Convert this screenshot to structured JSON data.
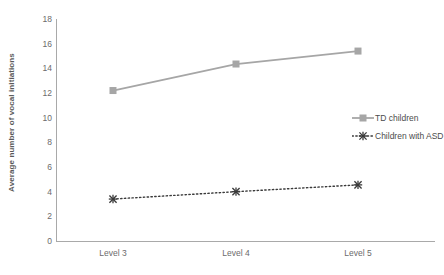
{
  "chart_data": {
    "type": "line",
    "title": "",
    "xlabel": "",
    "ylabel": "Average number of vocal initiations",
    "categories": [
      "Level 3",
      "Level 4",
      "Level 5"
    ],
    "ylim": [
      0,
      18
    ],
    "ytick_step": 2,
    "yticks": [
      "18",
      "16",
      "14",
      "12",
      "10",
      "8",
      "6",
      "4",
      "2",
      "0"
    ],
    "grid": false,
    "legend_position": "center right",
    "series": [
      {
        "name": "TD children",
        "values": [
          12.2,
          14.35,
          15.4
        ],
        "color": "#a6a6a6",
        "line_style": "solid",
        "marker": "square"
      },
      {
        "name": "Children with ASD",
        "values": [
          3.4,
          4.0,
          4.55
        ],
        "color": "#3a3a3a",
        "line_style": "dotted",
        "marker": "x-star"
      }
    ]
  },
  "legend": {
    "items": [
      {
        "label": "TD children",
        "marker_icon": "square-marker-icon"
      },
      {
        "label": "Children with ASD",
        "marker_icon": "x-marker-icon"
      }
    ]
  }
}
